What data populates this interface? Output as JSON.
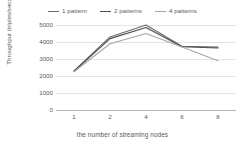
{
  "chart_data": {
    "type": "line",
    "title": "",
    "xlabel": "the number of streaming nodes",
    "ylabel": "Throughput (triples/second)",
    "x": [
      1,
      2,
      4,
      6,
      8
    ],
    "xtick_labels": [
      "1",
      "2",
      "4",
      "6",
      "8"
    ],
    "ytick_labels": [
      "0",
      "1000",
      "2000",
      "3000",
      "4000",
      "5000"
    ],
    "yticks": [
      0,
      1000,
      2000,
      3000,
      4000,
      5000
    ],
    "ylim": [
      0,
      5000
    ],
    "grid": true,
    "legend_position": "top-center",
    "series": [
      {
        "name": "1 pattern",
        "color": "#6b6b6b",
        "values": [
          2300,
          4300,
          5000,
          3750,
          3700
        ]
      },
      {
        "name": "2 patterns",
        "color": "#4d4d4d",
        "values": [
          2280,
          4200,
          4850,
          3720,
          3650
        ]
      },
      {
        "name": "4 patterns",
        "color": "#a6a6a6",
        "values": [
          2250,
          3900,
          4500,
          3700,
          2900
        ]
      }
    ]
  }
}
